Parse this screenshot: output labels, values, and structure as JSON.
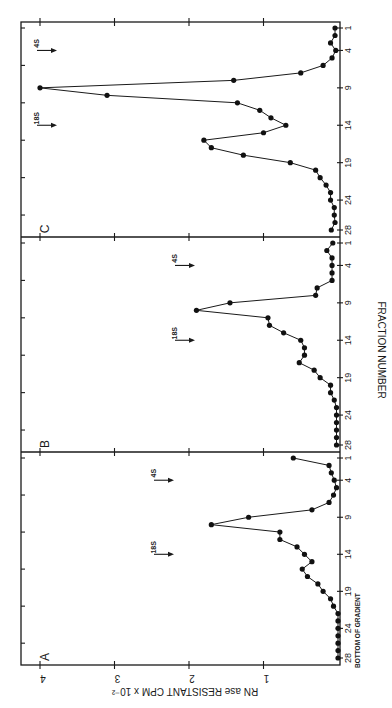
{
  "chart_data": {
    "type": "line",
    "orientation": "rotated 90° clockwise (value axis runs horizontally, fraction axis vertically)",
    "title": "",
    "xlabel": "FRACTION NUMBER",
    "ylabel": "RNase RESISTANT CPM x 10^-2",
    "ylabel_display": "RN ase RESISTANT CPM x 10⁻²",
    "ylim": [
      0,
      4
    ],
    "yticks": [
      1,
      2,
      3,
      4
    ],
    "xticks": [
      28,
      24,
      19,
      14,
      9,
      4,
      1
    ],
    "x_annotation": "BOTTOM OF GRADIENT",
    "grid": false,
    "legend": null,
    "panels": [
      {
        "label": "A",
        "markers": [
          {
            "label": "18S",
            "fraction": 14
          },
          {
            "label": "4S",
            "fraction": 4
          }
        ],
        "x": [
          1,
          2,
          3,
          4,
          5,
          6,
          7,
          8,
          9,
          10,
          11,
          12,
          13,
          14,
          15,
          16,
          17,
          18,
          19,
          20,
          21,
          22,
          23,
          24,
          25,
          26,
          27,
          28
        ],
        "values": [
          0.6,
          0.12,
          0.09,
          0.05,
          0.02,
          0.06,
          0.12,
          0.35,
          1.2,
          1.7,
          0.78,
          0.78,
          0.55,
          0.45,
          0.35,
          0.48,
          0.41,
          0.27,
          0.2,
          0.1,
          0.06,
          0.0,
          0.0,
          0.0,
          0.0,
          0.0,
          0.0,
          0.0
        ]
      },
      {
        "label": "B",
        "markers": [
          {
            "label": "18S",
            "fraction": 14
          },
          {
            "label": "4S",
            "fraction": 4
          }
        ],
        "x": [
          1,
          2,
          3,
          4,
          5,
          6,
          7,
          8,
          9,
          10,
          11,
          12,
          13,
          14,
          15,
          16,
          17,
          18,
          19,
          20,
          21,
          22,
          23,
          24,
          25,
          26,
          27,
          28
        ],
        "values": [
          0.07,
          0.15,
          0.08,
          0.08,
          0.08,
          0.08,
          0.28,
          0.3,
          1.45,
          1.9,
          0.94,
          0.92,
          0.73,
          0.5,
          0.45,
          0.45,
          0.52,
          0.32,
          0.24,
          0.1,
          0.1,
          0.05,
          0.02,
          0.02,
          0.02,
          0.02,
          0.02,
          0.02
        ]
      },
      {
        "label": "C",
        "markers": [
          {
            "label": "18S",
            "fraction": 14
          },
          {
            "label": "4S",
            "fraction": 4
          }
        ],
        "x": [
          1,
          2,
          3,
          4,
          5,
          6,
          7,
          8,
          9,
          10,
          11,
          12,
          13,
          14,
          15,
          16,
          17,
          18,
          19,
          20,
          21,
          22,
          23,
          24,
          25,
          26,
          27,
          28
        ],
        "values": [
          0.04,
          0.04,
          0.1,
          0.03,
          0.08,
          0.2,
          0.5,
          1.4,
          4.0,
          3.1,
          1.35,
          1.05,
          0.9,
          0.7,
          1.0,
          1.8,
          1.7,
          1.27,
          0.64,
          0.3,
          0.24,
          0.16,
          0.1,
          0.1,
          0.05,
          0.05,
          0.04,
          0.09
        ]
      }
    ]
  },
  "labels": {
    "xlabel": "FRACTION NUMBER",
    "ylabel": "RN ase RESISTANT CPM x 10⁻²",
    "bottom": "BOTTOM OF GRADIENT",
    "panelA": "A",
    "panelB": "B",
    "panelC": "C",
    "marker18S": "18S",
    "marker4S": "4S"
  },
  "colors": {
    "ink": "#1a1a1a",
    "background": "#ffffff"
  }
}
